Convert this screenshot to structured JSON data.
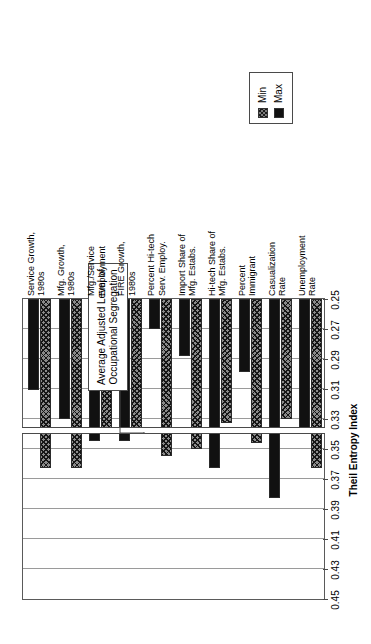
{
  "legend": {
    "items": [
      {
        "label": "Min",
        "pattern": "hatched",
        "color": "#7c7c7c"
      },
      {
        "label": "Max",
        "pattern": "solid",
        "color": "#111111"
      }
    ]
  },
  "annotation": {
    "text": "Average Adjusted Level of Occupational Segregation",
    "value": 0.338
  },
  "axis": {
    "title": "Theil Entropy Index",
    "ticks": [
      "0.45",
      "0.43",
      "0.41",
      "0.39",
      "0.37",
      "0.35",
      "0.33",
      "0.31",
      "0.29",
      "0.27",
      "0.25"
    ]
  },
  "chart_data": {
    "type": "bar",
    "orientation": "horizontal",
    "title": "",
    "xlabel": "Theil Entropy Index",
    "ylabel": "",
    "xlim": [
      0.45,
      0.25
    ],
    "axis_reversed": true,
    "baseline": 0.25,
    "grid": true,
    "legend_position": "top-center",
    "reference_line": {
      "label": "Average Adjusted Level of Occupational Segregation",
      "value": 0.338
    },
    "categories": [
      "Service Growth, 1980s",
      "Mfg. Growth, 1980s",
      "Mfg./Service Employment",
      "FIRE Growth, 1980s",
      "Percent Hi-tech Serv. Employ.",
      "Import Share of Mfg. Estabs.",
      "Hi-tech Share of Mfg. Estabs.",
      "Percent Immigrant",
      "Casualization Rate",
      "Unemployment Rate"
    ],
    "series": [
      {
        "name": "Min",
        "values": [
          0.363,
          0.363,
          0.339,
          0.339,
          0.355,
          0.35,
          0.333,
          0.346,
          0.33,
          0.363
        ]
      },
      {
        "name": "Max",
        "values": [
          0.311,
          0.33,
          0.345,
          0.345,
          0.27,
          0.288,
          0.363,
          0.299,
          0.383,
          0.337
        ]
      }
    ]
  }
}
